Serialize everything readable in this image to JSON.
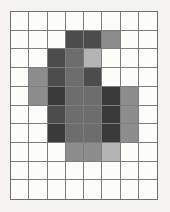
{
  "figure": {
    "type": "pixel-grid",
    "background_color": "#f4f3ef",
    "grid_line_color": "#7d7d7d",
    "grid_border_color": "#6e6e6e",
    "empty_cell_color": "#fcfcfa",
    "columns": 8,
    "rows": 10,
    "bounds": {
      "x": 10,
      "y": 11,
      "width": 148,
      "height": 189
    },
    "cell_width": 18.5,
    "cell_height": 18.9
  },
  "palette": {
    "empty": "#fcfcfa",
    "light": "#b4b4b4",
    "medium": "#8d8d8d",
    "medium_dark": "#6d6d6d",
    "dark": "#4c4c4c",
    "very_dark": "#3a3a3a"
  },
  "chart_data": {
    "type": "heatmap",
    "title": "",
    "xlabel": "",
    "ylabel": "",
    "columns": 8,
    "rows": 10,
    "color_scale": {
      "empty": "#fcfcfa",
      "light": "#b4b4b4",
      "medium": "#8d8d8d",
      "medium_dark": "#6d6d6d",
      "dark": "#4c4c4c",
      "very_dark": "#3a3a3a"
    },
    "cells": [
      [
        "empty",
        "empty",
        "empty",
        "empty",
        "empty",
        "empty",
        "empty",
        "empty"
      ],
      [
        "empty",
        "empty",
        "empty",
        "dark",
        "dark",
        "medium",
        "empty",
        "empty"
      ],
      [
        "empty",
        "empty",
        "dark",
        "medium_dark",
        "light",
        "empty",
        "empty",
        "empty"
      ],
      [
        "empty",
        "medium",
        "dark",
        "medium_dark",
        "dark",
        "empty",
        "empty",
        "empty"
      ],
      [
        "empty",
        "medium",
        "very_dark",
        "medium_dark",
        "medium_dark",
        "very_dark",
        "medium",
        "empty"
      ],
      [
        "empty",
        "empty",
        "dark",
        "medium_dark",
        "medium_dark",
        "very_dark",
        "medium",
        "empty"
      ],
      [
        "empty",
        "empty",
        "very_dark",
        "medium_dark",
        "medium_dark",
        "very_dark",
        "medium",
        "empty"
      ],
      [
        "empty",
        "empty",
        "empty",
        "medium",
        "medium",
        "light",
        "empty",
        "empty"
      ],
      [
        "empty",
        "empty",
        "empty",
        "empty",
        "empty",
        "empty",
        "empty",
        "empty"
      ],
      [
        "empty",
        "empty",
        "empty",
        "empty",
        "empty",
        "empty",
        "empty",
        "empty"
      ]
    ]
  }
}
